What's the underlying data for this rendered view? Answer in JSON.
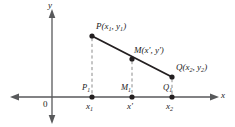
{
  "figure": {
    "colors": {
      "axis": "#58595b",
      "segment": "#231f20",
      "dashed": "#8c8c8c",
      "text": "#1a1a1a",
      "background": "#ffffff"
    },
    "axes": {
      "x_label": "x",
      "y_label": "y",
      "origin_label": "0"
    },
    "points": [
      {
        "key": "P",
        "label_name": "P",
        "label_coords": "(x1 , y1)"
      },
      {
        "key": "M",
        "label_name": "M",
        "label_coords": "(x' , y')"
      },
      {
        "key": "Q",
        "label_name": "Q",
        "label_coords": "(x2 , y2)"
      }
    ],
    "point_labels": {
      "p": {
        "name": "P",
        "sub_open": "(",
        "x_var": "x",
        "x_sub": "1",
        "sep": ", ",
        "y_var": "y",
        "y_sub": "1",
        "close": ")"
      },
      "m": {
        "name": "M",
        "text": "(x', y')"
      },
      "q": {
        "name": "Q",
        "sub_open": "(",
        "x_var": "x",
        "x_sub": "2",
        "sep": ", ",
        "y_var": "y",
        "y_sub": "2",
        "close": ")"
      }
    },
    "foot_labels": {
      "p1_name": "P",
      "p1_sub": "1",
      "m1_name": "M",
      "m1_sub": "1",
      "q1_name": "Q",
      "q1_sub": "1"
    },
    "tick_labels": {
      "x1_var": "x",
      "x1_sub": "1",
      "xprime": "x'",
      "x2_var": "x",
      "x2_sub": "2"
    }
  }
}
